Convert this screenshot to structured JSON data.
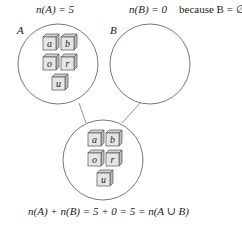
{
  "labels": {
    "nA": "n(A) = 5",
    "nB": "n(B) = 0",
    "because": "because B = ∅",
    "setA": "A",
    "setB": "B",
    "equation": "n(A) + n(B) = 5 + 0 = 5 = n(A ∪ B)"
  },
  "setA": {
    "elements": [
      "a",
      "b",
      "o",
      "r",
      "u"
    ]
  },
  "setB": {
    "elements": []
  },
  "union": {
    "elements": [
      "a",
      "b",
      "o",
      "r",
      "u"
    ]
  },
  "colors": {
    "stroke": "#555555",
    "cube_front": "#e6e6e6",
    "cube_side": "#bdbdbd",
    "cube_top": "#d2d2d2"
  }
}
